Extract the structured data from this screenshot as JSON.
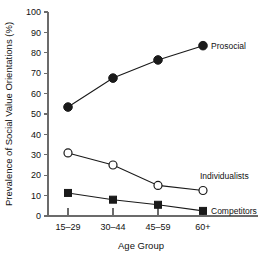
{
  "chart_data": {
    "type": "line",
    "title": "",
    "xlabel": "Age Group",
    "ylabel": "Prevalence of Social Value Orientations (%)",
    "categories": [
      "15–29",
      "30–44",
      "45–59",
      "60+"
    ],
    "ylim": [
      0,
      100
    ],
    "yticks": [
      0,
      10,
      20,
      30,
      40,
      50,
      60,
      70,
      80,
      90,
      100
    ],
    "ytick_labels": [
      "0",
      "10",
      "20",
      "30",
      "40",
      "50",
      "60",
      "70",
      "80",
      "90",
      "100"
    ],
    "grid": false,
    "legend_position": "inline-right",
    "series": [
      {
        "name": "Prosocial",
        "marker": "filled-circle",
        "values": [
          53.4,
          67.6,
          76.5,
          83.5
        ]
      },
      {
        "name": "Individualists",
        "marker": "open-circle",
        "values": [
          30.9,
          25.0,
          15.0,
          12.5
        ]
      },
      {
        "name": "Competitors",
        "marker": "filled-square",
        "values": [
          11.3,
          8.0,
          5.5,
          2.5
        ]
      }
    ]
  }
}
